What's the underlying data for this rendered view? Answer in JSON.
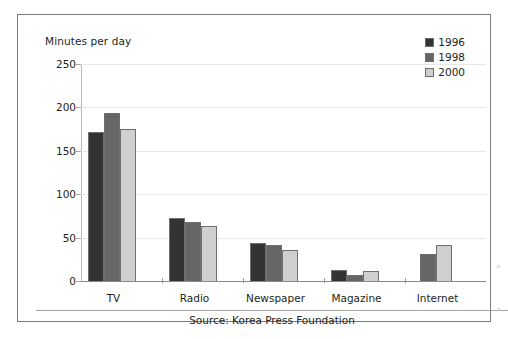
{
  "axis_title": "Minutes per day",
  "source_note": "Source: Korea Press Foundation",
  "legend": {
    "position": "top-right",
    "entries": [
      {
        "label": "1996",
        "color": "#333333"
      },
      {
        "label": "1998",
        "color": "#666666"
      },
      {
        "label": "2000",
        "color": "#cfcfcf"
      }
    ]
  },
  "yticks": [
    "0",
    "50",
    "100",
    "150",
    "200",
    "250"
  ],
  "chart_data": {
    "type": "bar",
    "title": "",
    "subtitle": "",
    "xlabel": "",
    "ylabel": "Minutes per day",
    "ylim": [
      0,
      250
    ],
    "ytick_step": 50,
    "grid": true,
    "legend_position": "top-right",
    "categories": [
      "TV",
      "Radio",
      "Newspaper",
      "Magazine",
      "Internet"
    ],
    "series": [
      {
        "name": "1996",
        "color": "#333333",
        "values": [
          172,
          73,
          44,
          13,
          null
        ]
      },
      {
        "name": "1998",
        "color": "#666666",
        "values": [
          194,
          68,
          41,
          7,
          31
        ]
      },
      {
        "name": "2000",
        "color": "#cfcfcf",
        "values": [
          175,
          63,
          36,
          11,
          42
        ]
      }
    ],
    "annotations": [
      "Source: Korea Press Foundation"
    ]
  }
}
